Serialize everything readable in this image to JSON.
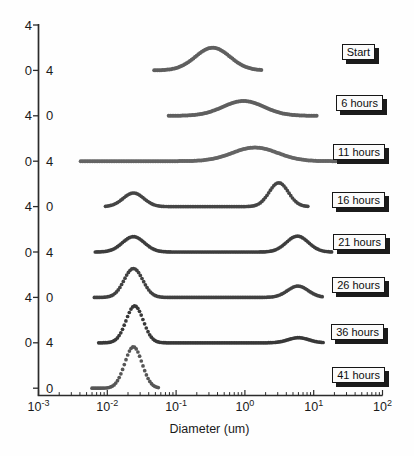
{
  "figure": {
    "kind": "particle-size-distribution-over-time",
    "background": "#fefefe",
    "axis_color": "#2b2b2b",
    "text_color": "#1a1a1a"
  },
  "chart_data": {
    "type": "line",
    "title": "",
    "xlabel": "Diameter (um)",
    "x_scale": "log",
    "x_range_exponents": [
      -3,
      2
    ],
    "x_major_ticks": [
      {
        "base": "10",
        "exponent": "-3"
      },
      {
        "base": "10",
        "exponent": "-2"
      },
      {
        "base": "10",
        "exponent": "-1"
      },
      {
        "base": "10",
        "exponent": "0"
      },
      {
        "base": "10",
        "exponent": "1"
      },
      {
        "base": "10",
        "exponent": "2"
      }
    ],
    "x_minor_ticks": "log multiples 2-9 each decade",
    "y_units_per_curve": 4,
    "y_tick_labels_left": [
      "4",
      "0",
      "4",
      "0",
      "4",
      "0",
      "4",
      "0"
    ],
    "y_tick_labels_right": [
      "4",
      "0",
      "4",
      "0",
      "4",
      "0",
      "4",
      "0"
    ],
    "legend_position": "right-boxed-labels",
    "grid": false,
    "series": [
      {
        "name": "Start",
        "color": "#5f5f5f",
        "draw_range_um": [
          0.048,
          1.75
        ],
        "peaks": [
          {
            "center_um": 0.34,
            "sigma_decades": 0.25,
            "height": 2.0
          }
        ]
      },
      {
        "name": "6 hours",
        "color": "#5f5f5f",
        "draw_range_um": [
          0.078,
          11.5
        ],
        "peaks": [
          {
            "center_um": 0.95,
            "sigma_decades": 0.3,
            "height": 1.3
          }
        ]
      },
      {
        "name": "11 hours",
        "color": "#646464",
        "draw_range_um": [
          0.0041,
          21.0
        ],
        "peaks": [
          {
            "center_um": 1.4,
            "sigma_decades": 0.33,
            "height": 1.2
          }
        ]
      },
      {
        "name": "16 hours",
        "color": "#454545",
        "draw_range_um": [
          0.0094,
          8.5
        ],
        "peaks": [
          {
            "center_um": 0.024,
            "sigma_decades": 0.15,
            "height": 1.2
          },
          {
            "center_um": 3.1,
            "sigma_decades": 0.14,
            "height": 2.1
          }
        ]
      },
      {
        "name": "21 hours",
        "color": "#3d3d3d",
        "draw_range_um": [
          0.0067,
          19.0
        ],
        "peaks": [
          {
            "center_um": 0.024,
            "sigma_decades": 0.16,
            "height": 1.35
          },
          {
            "center_um": 5.8,
            "sigma_decades": 0.16,
            "height": 1.4
          }
        ]
      },
      {
        "name": "26 hours",
        "color": "#414141",
        "draw_range_um": [
          0.0065,
          14.0
        ],
        "peaks": [
          {
            "center_um": 0.024,
            "sigma_decades": 0.135,
            "height": 2.55
          },
          {
            "center_um": 5.9,
            "sigma_decades": 0.15,
            "height": 1.0
          }
        ]
      },
      {
        "name": "36 hours",
        "color": "#383838",
        "draw_range_um": [
          0.0075,
          14.5
        ],
        "peaks": [
          {
            "center_um": 0.025,
            "sigma_decades": 0.125,
            "height": 3.25
          },
          {
            "center_um": 6.0,
            "sigma_decades": 0.15,
            "height": 0.45
          }
        ]
      },
      {
        "name": "41 hours",
        "color": "#565656",
        "draw_range_um": [
          0.006,
          0.056
        ],
        "peaks": [
          {
            "center_um": 0.024,
            "sigma_decades": 0.125,
            "height": 3.65
          }
        ]
      }
    ]
  }
}
